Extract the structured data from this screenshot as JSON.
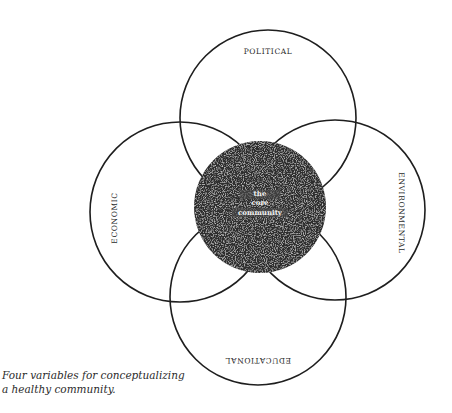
{
  "diagram": {
    "title": "Four variables for conceptualizing a healthy community",
    "circles": [
      {
        "id": "political",
        "label": "POLITICAL",
        "cx": 268,
        "cy": 118,
        "r": 88,
        "label_rotation": 0
      },
      {
        "id": "economic",
        "label": "ECONOMIC",
        "cx": 180,
        "cy": 212,
        "r": 90,
        "label_rotation": -90
      },
      {
        "id": "environmental",
        "label": "ENVIRONMENTAL",
        "cx": 335,
        "cy": 210,
        "r": 90,
        "label_rotation": 90
      },
      {
        "id": "educational",
        "label": "EDUCATIONAL",
        "cx": 258,
        "cy": 297,
        "r": 88,
        "label_rotation": 180
      }
    ],
    "core": {
      "label_lines": [
        "the",
        "core",
        "community"
      ],
      "cx": 260,
      "cy": 207,
      "r": 66,
      "fill": "#2e2e2e"
    },
    "stroke_color": "#1e1e1e",
    "text_color": "#2a2a2a"
  },
  "labels": {
    "political": "POLITICAL",
    "economic": "ECONOMIC",
    "environmental": "ENVIRONMENTAL",
    "educational": "EDUCATIONAL",
    "core_line1": "the",
    "core_line2": "core",
    "core_line3": "community"
  },
  "caption": {
    "line1": "Four variables for conceptualizing",
    "line2": "a healthy community."
  }
}
